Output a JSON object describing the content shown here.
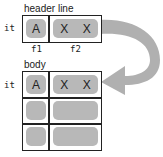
{
  "header": {
    "title": "header line",
    "row_label": "it",
    "cells": [
      "A",
      "X",
      "X"
    ],
    "field_labels": [
      "f1",
      "f2"
    ]
  },
  "body": {
    "title": "body",
    "row_label": "it",
    "first_row_cells": [
      "A",
      "X",
      "X"
    ],
    "row_count": 3
  },
  "colors": {
    "cell_fill": "#b8b8b8",
    "arrow_fill": "#b0b0b0",
    "border": "#222222"
  }
}
